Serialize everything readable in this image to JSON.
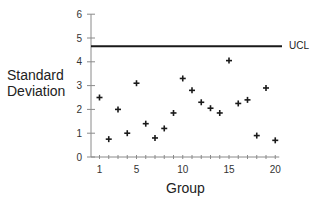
{
  "chart_data": {
    "type": "scatter",
    "title": "",
    "xlabel": "Group",
    "ylabel": "Standard Deviation",
    "ylabel_lines": [
      "Standard",
      "Deviation"
    ],
    "x": [
      1,
      2,
      3,
      4,
      5,
      6,
      7,
      8,
      9,
      10,
      11,
      12,
      13,
      14,
      15,
      16,
      17,
      18,
      19,
      20
    ],
    "series": [
      {
        "name": "Standard Deviation",
        "marker": "+",
        "values": [
          2.5,
          0.75,
          2.0,
          1.0,
          3.1,
          1.4,
          0.8,
          1.2,
          1.85,
          3.3,
          2.8,
          2.3,
          2.05,
          1.85,
          4.05,
          2.25,
          2.4,
          0.9,
          2.9,
          0.7
        ]
      }
    ],
    "reference_lines": [
      {
        "label": "UCL",
        "value": 4.65,
        "orientation": "horizontal"
      }
    ],
    "xlim": [
      0.2,
      20.5
    ],
    "ylim": [
      0,
      6
    ],
    "x_tick_labels": [
      "1",
      "5",
      "10",
      "15",
      "20"
    ],
    "x_tick_label_positions": [
      1,
      5,
      10,
      15,
      20
    ],
    "x_minor_ticks": [
      1,
      2,
      3,
      4,
      5,
      6,
      7,
      8,
      9,
      10,
      11,
      12,
      13,
      14,
      15,
      16,
      17,
      18,
      19,
      20
    ],
    "y_tick_labels": [
      "0",
      "1",
      "2",
      "3",
      "4",
      "5",
      "6"
    ],
    "y_ticks": [
      0,
      1,
      2,
      3,
      4,
      5,
      6
    ],
    "grid": false,
    "legend": null
  },
  "labels": {
    "ylabel_line1": "Standard",
    "ylabel_line2": "Deviation",
    "xlabel": "Group",
    "ucl": "UCL"
  },
  "colors": {
    "ink": "#1a1a1a",
    "axis": "#8a8a8a",
    "background": "#ffffff"
  }
}
